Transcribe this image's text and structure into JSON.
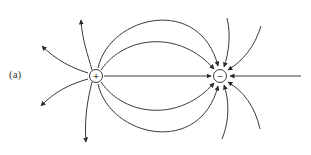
{
  "figure": {
    "label": "(a)",
    "charges": [
      {
        "id": "positive",
        "sign": "+",
        "x": 96,
        "y": 76
      },
      {
        "id": "negative",
        "sign": "−",
        "x": 220,
        "y": 76
      }
    ],
    "field_line_color": "#3a3a3a"
  }
}
